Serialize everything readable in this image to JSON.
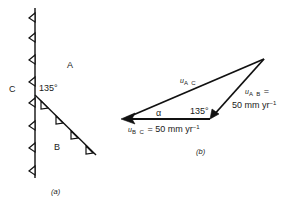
{
  "figure_a": {
    "caption": "(a)",
    "plates": {
      "A": "A",
      "B": "B",
      "C": "C"
    },
    "angle_label": "135°",
    "boundaries": [
      {
        "name": "vertical-subduction-zone",
        "from": [
          35,
          8
        ],
        "to": [
          35,
          176
        ],
        "teeth_side": "left",
        "teeth_count": 8
      },
      {
        "name": "oblique-subduction-zone",
        "from": [
          35,
          95
        ],
        "to": [
          96,
          155
        ],
        "teeth_side": "below-left",
        "teeth_count": 4
      }
    ]
  },
  "figure_b": {
    "caption": "(b)",
    "vectors": {
      "AC": {
        "symbol": "u",
        "subscript": "A C",
        "label": ""
      },
      "AB": {
        "symbol": "u",
        "subscript": "A B",
        "equals": "=",
        "value": "50 mm yr",
        "exponent": "−1"
      },
      "BC": {
        "symbol": "u",
        "subscript": "B C",
        "equals": "= 50 mm yr",
        "exponent": "−1"
      }
    },
    "angle_alpha": "α",
    "angle_135": "135°"
  }
}
